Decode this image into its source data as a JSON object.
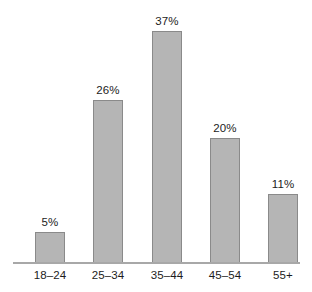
{
  "chart_data": {
    "type": "bar",
    "title": "",
    "subtitle": "",
    "xlabel": "",
    "ylabel": "",
    "categories": [
      "18–24",
      "25–34",
      "35–44",
      "45–54",
      "55+"
    ],
    "values": [
      5,
      26,
      37,
      20,
      11
    ],
    "value_labels": [
      "5%",
      "26%",
      "37%",
      "20%",
      "11%"
    ],
    "ylim": [
      0,
      42
    ],
    "grid": false,
    "legend": null,
    "annotations": [],
    "colors": {
      "bar_fill": "#b5b5b5",
      "bar_border": "#8a8a8a",
      "axis_line": "#a8a8a8",
      "text": "#1c1c1c",
      "background": "#ffffff"
    }
  }
}
